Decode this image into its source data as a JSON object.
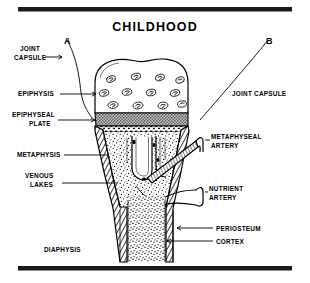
{
  "figure": {
    "title": "CHILDHOOD",
    "width": 310,
    "height": 283,
    "ink_color": "#000000",
    "paper_color": "#ffffff",
    "plate_fill": "#b9b9b9"
  },
  "callouts": {
    "a_marker": "A",
    "b_marker": "B"
  },
  "labels": {
    "joint_capsule_left_line1": "JOINT",
    "joint_capsule_left_line2": "CAPSULE",
    "joint_capsule_right": "JOINT CAPSULE",
    "epiphysis": "EPIPHYSIS",
    "epiphyseal_plate_line1": "EPIPHYSEAL",
    "epiphyseal_plate_line2": "PLATE",
    "metaphysis": "METAPHYSIS",
    "venous_lakes_line1": "VENOUS",
    "venous_lakes_line2": "LAKES",
    "metaphyseal_artery_line1": "METAPHYSEAL",
    "metaphyseal_artery_line2": "ARTERY",
    "nutrient_artery_line1": "NUTRIENT",
    "nutrient_artery_line2": "ARTERY",
    "periosteum": "PERIOSTEUM",
    "cortex": "CORTEX",
    "diaphysis": "DIAPHYSIS"
  },
  "anatomy": {
    "regions": [
      "epiphysis",
      "epiphyseal plate",
      "metaphysis",
      "diaphysis",
      "cortex",
      "periosteum"
    ],
    "vessels": [
      "metaphyseal artery",
      "nutrient artery",
      "venous lakes"
    ],
    "epiphysis_cell_count": 12
  }
}
